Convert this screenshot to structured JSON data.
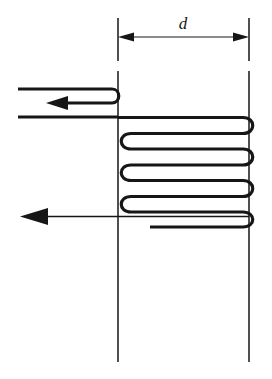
{
  "figure": {
    "name": "serpentine-coil-flow-diagram",
    "background_color": "#ffffff",
    "line_color": "#161616",
    "width": 272,
    "height": 379
  },
  "dimension": {
    "label": "d",
    "label_style": "italic",
    "arrow_style": "double-headed",
    "y": 37,
    "x_start": 118,
    "x_end": 249
  },
  "extension_lines": {
    "left_x": 118,
    "right_x": 249,
    "top_y": 18,
    "bottom_y": 362,
    "break_top": 60,
    "break_bottom": 72
  },
  "inlet": {
    "label": "",
    "upper_line_y": 89,
    "lower_line_y": 117,
    "return_line_y": 103,
    "x_left": 18,
    "hairpin_x": 118,
    "arrow_x": 58,
    "arrow_direction": "left"
  },
  "coil": {
    "runs": 7,
    "right_turns": 4,
    "left_turns": 3,
    "top_y": 118,
    "bottom_y": 212,
    "left_x": 122,
    "right_x": 253,
    "stroke_width": 3.2
  },
  "outlet": {
    "y": 216,
    "x_start": 249,
    "x_end": 20,
    "arrow_direction": "left",
    "stroke_width": 1.4
  }
}
